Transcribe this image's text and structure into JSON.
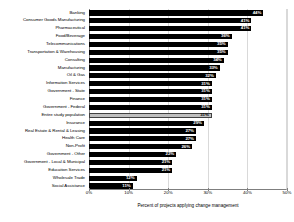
{
  "chart_data": {
    "type": "bar",
    "orientation": "horizontal",
    "title": "",
    "xlabel": "Percent of projects applying change management",
    "ylabel": "",
    "xlim": [
      0,
      50
    ],
    "xticks": [
      "0%",
      "10%",
      "20%",
      "30%",
      "40%",
      "50%"
    ],
    "xtick_values": [
      0,
      10,
      20,
      30,
      40,
      50
    ],
    "grid": true,
    "legend": "none",
    "value_suffix": "%",
    "categories": [
      "Banking",
      "Consumer Goods Manufacturing",
      "Pharmaceutical",
      "Food/Beverage",
      "Telecommunications",
      "Transportation & Warehousing",
      "Consulting",
      "Manufacturing",
      "Oil & Gas",
      "Information Services",
      "Government - State",
      "Finance",
      "Government - Federal",
      "Entire study population",
      "Insurance",
      "Real Estate & Rental & Leasing",
      "Health Care",
      "Non-Profit",
      "Government - Other",
      "Government - Local & Municipal",
      "Education Services",
      "Wholesale Trade",
      "Social Assistance"
    ],
    "values": [
      44,
      41,
      41,
      36,
      35,
      35,
      34,
      33,
      32,
      31,
      31,
      31,
      31,
      31,
      29,
      27,
      27,
      26,
      22,
      21,
      21,
      12,
      11
    ],
    "value_labels": [
      "44%",
      "41%",
      "41%",
      "36%",
      "35%",
      "35%",
      "34%",
      "33%",
      "32%",
      "31%",
      "31%",
      "31%",
      "31%",
      "31%",
      "29%",
      "27%",
      "27%",
      "26%",
      "22%",
      "21%",
      "21%",
      "12%",
      "11%"
    ],
    "highlight_index": 13,
    "colors": {
      "bar": "#000000",
      "highlight_bar": "#bfbfbf",
      "highlight_border": "#404040",
      "value_text": "#ffffff",
      "highlight_value_text": "#000000",
      "gridline": "#d9d9d9",
      "axis": "#7f7f7f",
      "background": "#ffffff"
    }
  }
}
